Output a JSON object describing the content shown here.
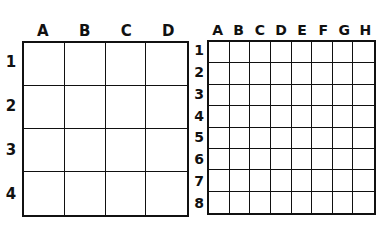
{
  "coarse_grid": {
    "columns": [
      "A",
      "B",
      "C",
      "D"
    ],
    "rows": [
      "1",
      "2",
      "3",
      "4"
    ]
  },
  "fine_grid": {
    "columns": [
      "A",
      "B",
      "C",
      "D",
      "E",
      "F",
      "G",
      "H"
    ],
    "rows": [
      "1",
      "2",
      "3",
      "4",
      "5",
      "6",
      "7",
      "8"
    ]
  },
  "colors": {
    "line": "#111111",
    "background": "#ffffff"
  }
}
